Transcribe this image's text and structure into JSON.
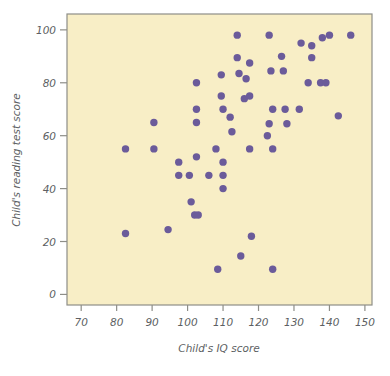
{
  "chart_data": {
    "type": "scatter",
    "title": "",
    "xlabel": "Child's IQ score",
    "ylabel": "Child's reading test score",
    "xlim": [
      66,
      152
    ],
    "ylim": [
      -4,
      106
    ],
    "xticks": [
      70,
      80,
      90,
      100,
      110,
      120,
      130,
      140,
      150
    ],
    "xtick_labels": [
      "70",
      "80",
      "90",
      "100",
      "110",
      "120",
      "130",
      "140",
      "150"
    ],
    "yticks": [
      0,
      20,
      40,
      60,
      80,
      100
    ],
    "ytick_labels": [
      "0",
      "20",
      "40",
      "60",
      "80",
      "100"
    ],
    "grid": false,
    "legend": "none",
    "marker_color": "#6b5b9a",
    "plot_background": "#f8eec6",
    "frame_color": "#8e8e88",
    "marker_size": 5,
    "points": [
      {
        "x": 82.5,
        "y": 55
      },
      {
        "x": 82.5,
        "y": 23
      },
      {
        "x": 90.5,
        "y": 65
      },
      {
        "x": 90.5,
        "y": 55
      },
      {
        "x": 94.5,
        "y": 24.5
      },
      {
        "x": 97.5,
        "y": 50
      },
      {
        "x": 97.5,
        "y": 45
      },
      {
        "x": 100.5,
        "y": 45
      },
      {
        "x": 101,
        "y": 35
      },
      {
        "x": 102,
        "y": 30
      },
      {
        "x": 103,
        "y": 30
      },
      {
        "x": 102.5,
        "y": 80
      },
      {
        "x": 102.5,
        "y": 70
      },
      {
        "x": 102.5,
        "y": 65
      },
      {
        "x": 102.5,
        "y": 52
      },
      {
        "x": 106,
        "y": 45
      },
      {
        "x": 108,
        "y": 55
      },
      {
        "x": 108.5,
        "y": 9.5
      },
      {
        "x": 109.5,
        "y": 83
      },
      {
        "x": 109.5,
        "y": 75
      },
      {
        "x": 110,
        "y": 70
      },
      {
        "x": 110,
        "y": 50
      },
      {
        "x": 110,
        "y": 45
      },
      {
        "x": 110,
        "y": 40
      },
      {
        "x": 112,
        "y": 67
      },
      {
        "x": 112.5,
        "y": 61.5
      },
      {
        "x": 114,
        "y": 98
      },
      {
        "x": 114,
        "y": 89.5
      },
      {
        "x": 114.5,
        "y": 83.5
      },
      {
        "x": 115,
        "y": 14.5
      },
      {
        "x": 116,
        "y": 74
      },
      {
        "x": 116.5,
        "y": 81.5
      },
      {
        "x": 117.5,
        "y": 87.5
      },
      {
        "x": 117.5,
        "y": 75
      },
      {
        "x": 117.5,
        "y": 55
      },
      {
        "x": 118,
        "y": 22
      },
      {
        "x": 122.5,
        "y": 60
      },
      {
        "x": 123,
        "y": 64.5
      },
      {
        "x": 123,
        "y": 98
      },
      {
        "x": 123.5,
        "y": 84.5
      },
      {
        "x": 124,
        "y": 70
      },
      {
        "x": 124,
        "y": 55
      },
      {
        "x": 124,
        "y": 9.5
      },
      {
        "x": 126.5,
        "y": 90
      },
      {
        "x": 127,
        "y": 84.5
      },
      {
        "x": 127.5,
        "y": 70
      },
      {
        "x": 128,
        "y": 64.5
      },
      {
        "x": 131.5,
        "y": 70
      },
      {
        "x": 132,
        "y": 95
      },
      {
        "x": 134,
        "y": 80
      },
      {
        "x": 135,
        "y": 89.5
      },
      {
        "x": 135,
        "y": 94
      },
      {
        "x": 137.5,
        "y": 80
      },
      {
        "x": 138,
        "y": 97
      },
      {
        "x": 139,
        "y": 80
      },
      {
        "x": 140,
        "y": 98
      },
      {
        "x": 142.5,
        "y": 67.5
      },
      {
        "x": 146,
        "y": 98
      }
    ]
  },
  "figure": {
    "page_background": "#ffffff"
  }
}
